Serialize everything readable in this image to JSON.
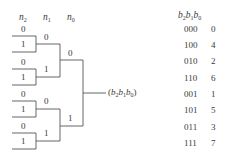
{
  "diagram": {
    "column_headers": [
      {
        "var": "n",
        "sub": "2"
      },
      {
        "var": "n",
        "sub": "1"
      },
      {
        "var": "n",
        "sub": "0"
      }
    ],
    "leaf_labels": [
      "0",
      "1",
      "0",
      "1",
      "0",
      "1",
      "0",
      "1"
    ],
    "level1_labels": [
      "0",
      "1",
      "0",
      "1"
    ],
    "level0_labels": [
      "0",
      "1"
    ],
    "output_label": {
      "open": "(",
      "parts": [
        {
          "var": "b",
          "sub": "2"
        },
        {
          "var": "b",
          "sub": "1"
        },
        {
          "var": "b",
          "sub": "0"
        }
      ],
      "close": ")"
    },
    "line_color": "#555555"
  },
  "table": {
    "header": {
      "parts": [
        {
          "var": "b",
          "sub": "2"
        },
        {
          "var": "b",
          "sub": "1"
        },
        {
          "var": "b",
          "sub": "0"
        }
      ]
    },
    "rows": [
      {
        "bits": "000",
        "value": "0"
      },
      {
        "bits": "100",
        "value": "4"
      },
      {
        "bits": "010",
        "value": "2"
      },
      {
        "bits": "110",
        "value": "6"
      },
      {
        "bits": "001",
        "value": "1"
      },
      {
        "bits": "101",
        "value": "5"
      },
      {
        "bits": "011",
        "value": "3"
      },
      {
        "bits": "111",
        "value": "7"
      }
    ]
  }
}
